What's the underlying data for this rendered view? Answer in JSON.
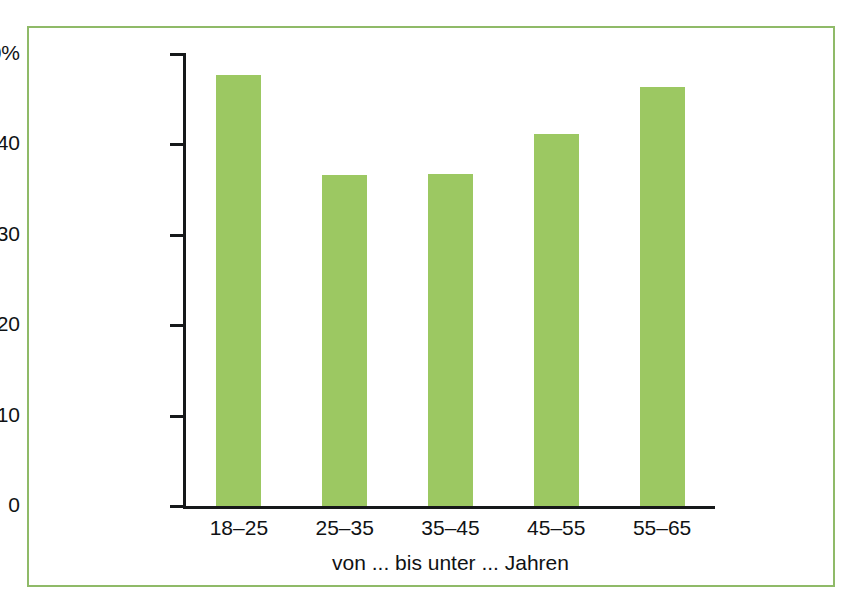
{
  "chart_data": {
    "type": "bar",
    "title": "",
    "subtitle": "",
    "xlabel": "von ... bis unter ... Jahren",
    "ylabel": "",
    "categories": [
      "18–25",
      "25–35",
      "35–45",
      "45–55",
      "55–65"
    ],
    "values": [
      47.7,
      36.6,
      36.7,
      41.2,
      46.3
    ],
    "ylim": [
      0,
      50
    ],
    "y_ticks": [
      0,
      10,
      20,
      30,
      40,
      50
    ],
    "y_tick_labels": [
      "0",
      "10",
      "20",
      "30",
      "40",
      "50%"
    ],
    "grid": false,
    "legend": null,
    "bar_color": "#9cc862",
    "axis_color": "#16181a",
    "frame_color": "#8fba68",
    "background": "#ffffff"
  },
  "figure": {
    "border_color": "#8fba68"
  }
}
